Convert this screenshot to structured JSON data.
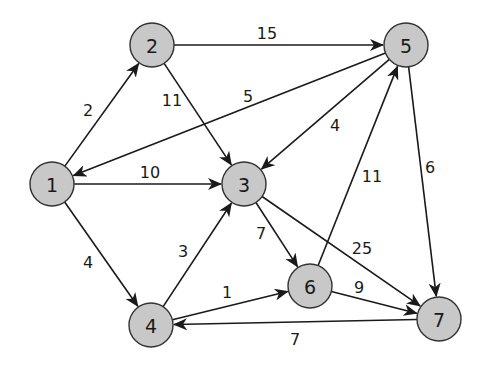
{
  "graph": {
    "node_fill": "#c8c8c8",
    "node_stroke": "#333333",
    "nodes": [
      {
        "id": "1",
        "label": "1",
        "x": 52,
        "y": 184
      },
      {
        "id": "2",
        "label": "2",
        "x": 152,
        "y": 45
      },
      {
        "id": "3",
        "label": "3",
        "x": 244,
        "y": 184
      },
      {
        "id": "4",
        "label": "4",
        "x": 151,
        "y": 325
      },
      {
        "id": "5",
        "label": "5",
        "x": 406,
        "y": 45
      },
      {
        "id": "6",
        "label": "6",
        "x": 310,
        "y": 286
      },
      {
        "id": "7",
        "label": "7",
        "x": 439,
        "y": 319
      }
    ],
    "edges": [
      {
        "from": "1",
        "to": "2",
        "weight": "2",
        "lx": 88,
        "ly": 110
      },
      {
        "from": "2",
        "to": "5",
        "weight": "15",
        "lx": 267,
        "ly": 33
      },
      {
        "from": "2",
        "to": "3",
        "weight": "11",
        "lx": 172,
        "ly": 100
      },
      {
        "from": "5",
        "to": "1",
        "weight": "5",
        "lx": 248,
        "ly": 96
      },
      {
        "from": "1",
        "to": "3",
        "weight": "10",
        "lx": 150,
        "ly": 172
      },
      {
        "from": "5",
        "to": "3",
        "weight": "4",
        "lx": 335,
        "ly": 125
      },
      {
        "from": "5",
        "to": "7",
        "weight": "6",
        "lx": 430,
        "ly": 167
      },
      {
        "from": "1",
        "to": "4",
        "weight": "4",
        "lx": 88,
        "ly": 262
      },
      {
        "from": "4",
        "to": "3",
        "weight": "3",
        "lx": 183,
        "ly": 251
      },
      {
        "from": "3",
        "to": "6",
        "weight": "7",
        "lx": 261,
        "ly": 233
      },
      {
        "from": "6",
        "to": "5",
        "weight": "11",
        "lx": 372,
        "ly": 176
      },
      {
        "from": "3",
        "to": "7",
        "weight": "25",
        "lx": 362,
        "ly": 248
      },
      {
        "from": "4",
        "to": "6",
        "weight": "1",
        "lx": 227,
        "ly": 292
      },
      {
        "from": "6",
        "to": "7",
        "weight": "9",
        "lx": 359,
        "ly": 287
      },
      {
        "from": "7",
        "to": "4",
        "weight": "7",
        "lx": 295,
        "ly": 339
      }
    ]
  }
}
